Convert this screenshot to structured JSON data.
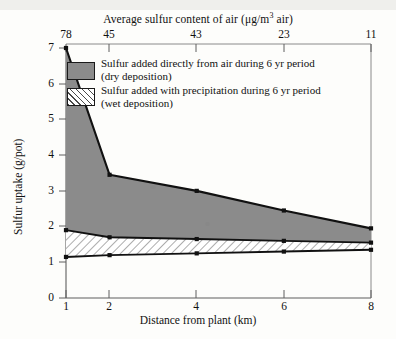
{
  "chart_data": {
    "type": "area",
    "title": "",
    "xlabel": "Distance from plant (km)",
    "ylabel": "Sulfur uptake (g/pot)",
    "top_axis_label": "Average sulfur content of air (μg/m³ air)",
    "x": [
      1,
      2,
      4,
      6,
      8
    ],
    "xlim": [
      1,
      8
    ],
    "ylim": [
      0,
      7
    ],
    "x_ticks": [
      "1",
      "2",
      "4",
      "6",
      "8"
    ],
    "y_ticks": [
      "0",
      "1",
      "2",
      "3",
      "4",
      "5",
      "6",
      "7"
    ],
    "top_ticks": [
      "78",
      "45",
      "43",
      "23",
      "11"
    ],
    "top_tick_positions": [
      1,
      2,
      4,
      6,
      8
    ],
    "grid": false,
    "legend_position": "inside-top",
    "stacked": true,
    "series": [
      {
        "name": "Sulfur added with precipitation during 6 yr period (wet deposition)",
        "short_name": "wet deposition",
        "values": [
          1.15,
          1.2,
          1.25,
          1.3,
          1.35
        ],
        "fill": "hatched",
        "color": "#ffffff"
      },
      {
        "name": "Sulfur added directly from air during 6 yr period (dry deposition)",
        "short_name": "dry deposition",
        "values": [
          1.9,
          1.7,
          1.65,
          1.6,
          1.55
        ],
        "fill": "solid",
        "color": "#8b8b8b"
      }
    ],
    "cumulative_top": [
      7.0,
      3.45,
      3.0,
      2.45,
      1.95
    ],
    "cumulative_mid": [
      1.9,
      1.7,
      1.65,
      1.6,
      1.55
    ],
    "cumulative_bottom": [
      1.15,
      1.2,
      1.25,
      1.3,
      1.35
    ]
  },
  "legend": {
    "dry_line1": "Sulfur added directly from air during 6 yr period",
    "dry_line2": "(dry deposition)",
    "wet_line1": "Sulfur added with precipitation during 6 yr period",
    "wet_line2": "(wet deposition)"
  },
  "axes": {
    "top_label_prefix": "Average sulfur content of air (μg/m",
    "top_label_sup": "3",
    "top_label_suffix": " air)",
    "x_title": "Distance from plant (km)",
    "y_title": "Sulfur uptake (g/pot)"
  },
  "colors": {
    "dry_fill": "#8b8b8b",
    "wet_fill": "#ffffff",
    "hatch": "#4a4a4a",
    "line": "#111111",
    "axis": "#6b6b6b",
    "background": "#fdfdfb"
  }
}
